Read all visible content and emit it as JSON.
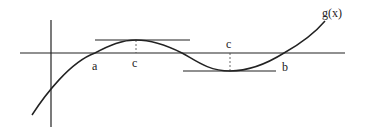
{
  "diagram": {
    "type": "function-graph",
    "colors": {
      "stroke": "#222222",
      "background": "#ffffff"
    },
    "labels": {
      "function": "g(x)",
      "root_left": "a",
      "root_right": "b",
      "critical_1": "c",
      "critical_2": "c"
    },
    "elements": [
      {
        "kind": "axis",
        "name": "x-axis"
      },
      {
        "kind": "axis",
        "name": "y-axis"
      },
      {
        "kind": "curve",
        "name": "g(x)"
      },
      {
        "kind": "tangent-line",
        "name": "horizontal tangent at local maximum c"
      },
      {
        "kind": "tangent-line",
        "name": "horizontal tangent at local minimum c"
      },
      {
        "kind": "dashed-line",
        "name": "drop line from maximum to axis"
      },
      {
        "kind": "dashed-line",
        "name": "drop line from axis to minimum"
      }
    ]
  }
}
